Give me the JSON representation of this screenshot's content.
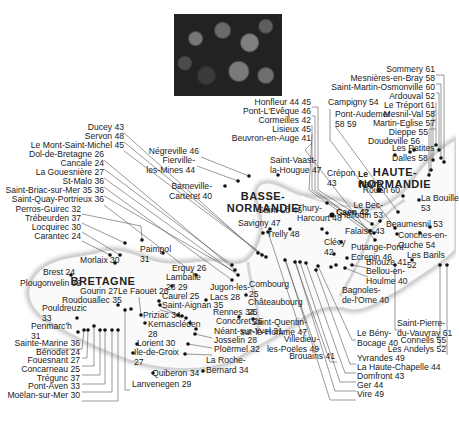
{
  "photo": {
    "description": "raspberries-and-blackberries-photo"
  },
  "regions": [
    {
      "name": "BRETAGNE",
      "x": 103,
      "y": 275
    },
    {
      "name": "BASSE-\nNORMANDIE",
      "x": 263,
      "y": 190
    },
    {
      "name": "HAUTE-\nNORMANDIE",
      "x": 395,
      "y": 166
    }
  ],
  "places": [
    {
      "label": "Sommery 61",
      "x": 435,
      "y": 71,
      "align": "right"
    },
    {
      "label": "Mesnières-en-Bray 58",
      "x": 435,
      "y": 80,
      "align": "right"
    },
    {
      "label": "Saint-Martin-Osmonville 60",
      "x": 435,
      "y": 89,
      "align": "right"
    },
    {
      "label": "Ardouval 52",
      "x": 435,
      "y": 98,
      "align": "right"
    },
    {
      "label": "Le Tréport 61",
      "x": 435,
      "y": 107,
      "align": "right"
    },
    {
      "label": "Mesnil-Val 58",
      "x": 435,
      "y": 116,
      "align": "right"
    },
    {
      "label": "Martin-Eglise 57",
      "x": 435,
      "y": 125,
      "align": "right"
    },
    {
      "label": "Dieppe 55",
      "x": 428,
      "y": 134,
      "align": "right"
    },
    {
      "label": "Doudeville 56",
      "x": 420,
      "y": 143,
      "align": "right"
    },
    {
      "label": "Les Petites\nDalles 58",
      "x": 392,
      "y": 150,
      "align": "left"
    },
    {
      "label": "Honfleur 44 45",
      "x": 311,
      "y": 104,
      "align": "right"
    },
    {
      "label": "Pont-L'Evêque 46",
      "x": 311,
      "y": 113,
      "align": "right"
    },
    {
      "label": "Cormeilles 42",
      "x": 311,
      "y": 122,
      "align": "right"
    },
    {
      "label": "Lisieux 45",
      "x": 311,
      "y": 131,
      "align": "right"
    },
    {
      "label": "Beuvron-en-Auge 41",
      "x": 311,
      "y": 140,
      "align": "right"
    },
    {
      "label": "Campigny 54",
      "x": 328,
      "y": 104,
      "align": "left"
    },
    {
      "label": "Pont-Audemer\n58 59",
      "x": 335,
      "y": 116,
      "align": "left"
    },
    {
      "label": "Le\nHavre",
      "x": 358,
      "y": 176,
      "align": "left",
      "bold": true
    },
    {
      "label": "Rouen 60",
      "x": 400,
      "y": 192,
      "align": "right"
    },
    {
      "label": "La Bouille\n53",
      "x": 421,
      "y": 200,
      "align": "left"
    },
    {
      "label": "Le Bec-\nHellouin 53",
      "x": 383,
      "y": 207,
      "align": "right"
    },
    {
      "label": "Beaumesnil 53",
      "x": 386,
      "y": 226,
      "align": "left"
    },
    {
      "label": "Conches-en-\nOuche 54",
      "x": 398,
      "y": 237,
      "align": "left"
    },
    {
      "label": "Les Barils\n52",
      "x": 407,
      "y": 257,
      "align": "left"
    },
    {
      "label": "Crépon\n43",
      "x": 327,
      "y": 175,
      "align": "left"
    },
    {
      "label": "Caen 42",
      "x": 336,
      "y": 214,
      "align": "left",
      "bold": true
    },
    {
      "label": "Thury-\nHarcourt 48",
      "x": 297,
      "y": 210,
      "align": "left"
    },
    {
      "label": "Falaise 43",
      "x": 345,
      "y": 233,
      "align": "left"
    },
    {
      "label": "Clécy\n42",
      "x": 324,
      "y": 244,
      "align": "left"
    },
    {
      "label": "Putange-Pont-\nEcrepin 46",
      "x": 351,
      "y": 249,
      "align": "left"
    },
    {
      "label": "Briouze 41",
      "x": 366,
      "y": 264,
      "align": "left"
    },
    {
      "label": "Bellou-en-\nHoulme 40",
      "x": 366,
      "y": 273,
      "align": "left"
    },
    {
      "label": "Bagnoles-\nde-l'Orne 40",
      "x": 342,
      "y": 292,
      "align": "left"
    },
    {
      "label": "Négreville 46",
      "x": 199,
      "y": 153,
      "align": "right"
    },
    {
      "label": "Fierville-\nles-Mines 44",
      "x": 195,
      "y": 162,
      "align": "right"
    },
    {
      "label": "Barneville-\nCarteret 40",
      "x": 212,
      "y": 188,
      "align": "right"
    },
    {
      "label": "Saint-Vaast-\nla-Hougue 47",
      "x": 270,
      "y": 162,
      "align": "left"
    },
    {
      "label": "Saint-Lô 46",
      "x": 258,
      "y": 212,
      "align": "left"
    },
    {
      "label": "Savigny 47",
      "x": 238,
      "y": 225,
      "align": "left"
    },
    {
      "label": "Trelly 48",
      "x": 267,
      "y": 236,
      "align": "left"
    },
    {
      "label": "Ducey 43",
      "x": 124,
      "y": 129,
      "align": "right"
    },
    {
      "label": "Servon 48",
      "x": 124,
      "y": 138,
      "align": "right"
    },
    {
      "label": "Le Mont-Saint-Michel 45",
      "x": 124,
      "y": 147,
      "align": "right"
    },
    {
      "label": "Dol-de-Bretagne 26",
      "x": 104,
      "y": 156,
      "align": "right"
    },
    {
      "label": "Cancale 24",
      "x": 104,
      "y": 165,
      "align": "right"
    },
    {
      "label": "La Gouesnière 27",
      "x": 104,
      "y": 174,
      "align": "right"
    },
    {
      "label": "St-Malo 36",
      "x": 104,
      "y": 183,
      "align": "right"
    },
    {
      "label": "Saint-Briac-sur-Mer 35 36",
      "x": 104,
      "y": 192,
      "align": "right"
    },
    {
      "label": "Saint-Quay-Portrieux 36",
      "x": 104,
      "y": 201,
      "align": "right"
    },
    {
      "label": "Perros-Guirec 32",
      "x": 81,
      "y": 211,
      "align": "right"
    },
    {
      "label": "Trébeurden 37",
      "x": 81,
      "y": 220,
      "align": "right"
    },
    {
      "label": "Locquirec 30",
      "x": 81,
      "y": 229,
      "align": "right"
    },
    {
      "label": "Carantec 24",
      "x": 81,
      "y": 238,
      "align": "right"
    },
    {
      "label": "Morlaix 30",
      "x": 80,
      "y": 262,
      "align": "left"
    },
    {
      "label": "Paimpol\n31",
      "x": 140,
      "y": 251,
      "align": "left"
    },
    {
      "label": "Brest 24",
      "x": 43,
      "y": 274,
      "align": "left"
    },
    {
      "label": "Plougonvelin 32",
      "x": 20,
      "y": 285,
      "align": "left"
    },
    {
      "label": "Erquy 26",
      "x": 172,
      "y": 270,
      "align": "left"
    },
    {
      "label": "Lamballe\n28 29",
      "x": 166,
      "y": 279,
      "align": "left"
    },
    {
      "label": "Jugon-les-\nLacs 28",
      "x": 210,
      "y": 289,
      "align": "left"
    },
    {
      "label": "Combourg\n25",
      "x": 249,
      "y": 286,
      "align": "left"
    },
    {
      "label": "Châteaubourg\n25",
      "x": 248,
      "y": 304,
      "align": "left"
    },
    {
      "label": "Gourin 27",
      "x": 80,
      "y": 293,
      "align": "left"
    },
    {
      "label": "Le Faouët 26",
      "x": 118,
      "y": 293,
      "align": "left"
    },
    {
      "label": "Caurel 25",
      "x": 162,
      "y": 298,
      "align": "left"
    },
    {
      "label": "Roudouallec 35",
      "x": 62,
      "y": 302,
      "align": "left"
    },
    {
      "label": "Saint-Aignan 35",
      "x": 162,
      "y": 307,
      "align": "left"
    },
    {
      "label": "Pouldreuzic\n33",
      "x": 42,
      "y": 310,
      "align": "left"
    },
    {
      "label": "Priziac 34",
      "x": 143,
      "y": 317,
      "align": "left"
    },
    {
      "label": "Kernascléden\n28",
      "x": 148,
      "y": 326,
      "align": "left"
    },
    {
      "label": "Rennes 34",
      "x": 213,
      "y": 314,
      "align": "left"
    },
    {
      "label": "Concoret 26",
      "x": 216,
      "y": 323,
      "align": "left"
    },
    {
      "label": "Néant-sur-Yvel 31",
      "x": 214,
      "y": 333,
      "align": "left"
    },
    {
      "label": "Josselin 28",
      "x": 214,
      "y": 342,
      "align": "left"
    },
    {
      "label": "Ploërmel 32",
      "x": 214,
      "y": 351,
      "align": "left"
    },
    {
      "label": "Penmarc'h\n31",
      "x": 31,
      "y": 328,
      "align": "left"
    },
    {
      "label": "Lorient 30",
      "x": 137,
      "y": 345,
      "align": "left"
    },
    {
      "label": "Ile-de-Groix\n27",
      "x": 134,
      "y": 354,
      "align": "left"
    },
    {
      "label": "La Roche-\nBernard 34",
      "x": 206,
      "y": 362,
      "align": "left"
    },
    {
      "label": "Quiberon 34",
      "x": 152,
      "y": 375,
      "align": "left"
    },
    {
      "label": "Lanvenegen 29",
      "x": 132,
      "y": 386,
      "align": "left"
    },
    {
      "label": "Sainte-Marine 36",
      "x": 80,
      "y": 345,
      "align": "right"
    },
    {
      "label": "Bénodet 24",
      "x": 80,
      "y": 354,
      "align": "right"
    },
    {
      "label": "Fouesnant 27",
      "x": 80,
      "y": 362,
      "align": "right"
    },
    {
      "label": "Concarneau 25",
      "x": 80,
      "y": 371,
      "align": "right"
    },
    {
      "label": "Trégunc 37",
      "x": 80,
      "y": 380,
      "align": "right"
    },
    {
      "label": "Pont-Aven 33",
      "x": 80,
      "y": 388,
      "align": "right"
    },
    {
      "label": "Moëlan-sur-Mer 30",
      "x": 80,
      "y": 397,
      "align": "right"
    },
    {
      "label": "Saint-Quentin-\nsur-le-Homme 47",
      "x": 307,
      "y": 324,
      "align": "right"
    },
    {
      "label": "Villedieu-\nles-Poëles 49",
      "x": 319,
      "y": 341,
      "align": "right"
    },
    {
      "label": "Brouains 41",
      "x": 335,
      "y": 358,
      "align": "right"
    },
    {
      "label": "Le Bény-\nBocage 40",
      "x": 357,
      "y": 335,
      "align": "left"
    },
    {
      "label": "Yvrandes 49",
      "x": 357,
      "y": 360,
      "align": "left"
    },
    {
      "label": "La Haute-Chapelle 44",
      "x": 357,
      "y": 369,
      "align": "left"
    },
    {
      "label": "Domfront 43",
      "x": 357,
      "y": 378,
      "align": "left"
    },
    {
      "label": "Ger 44",
      "x": 357,
      "y": 387,
      "align": "left"
    },
    {
      "label": "Vire 49",
      "x": 357,
      "y": 396,
      "align": "left"
    },
    {
      "label": "Saint-Pierre-\ndu-Vauvray 61",
      "x": 397,
      "y": 325,
      "align": "left"
    },
    {
      "label": "Connells 55",
      "x": 446,
      "y": 342,
      "align": "right"
    },
    {
      "label": "Les Andelys 52",
      "x": 446,
      "y": 351,
      "align": "right"
    }
  ]
}
